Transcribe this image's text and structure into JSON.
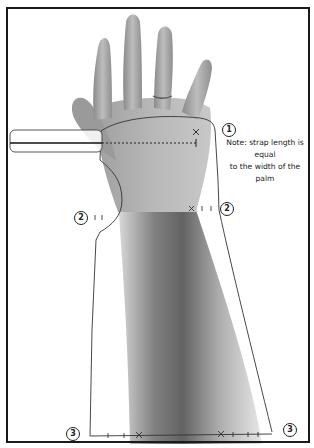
{
  "figure": {
    "note": {
      "line1": "Note: strap length is equal",
      "line2": "to the width of the palm"
    },
    "markers": [
      {
        "id": "marker-1",
        "label": "1"
      },
      {
        "id": "marker-2-left",
        "label": "2"
      },
      {
        "id": "marker-2-right",
        "label": "2"
      },
      {
        "id": "marker-3-left",
        "label": "3"
      },
      {
        "id": "marker-3-right",
        "label": "3"
      }
    ],
    "colors": {
      "background": "#ffffff",
      "frame": "#1a1a1a",
      "outline": "#333333",
      "skin_dark": "#6e6e6e",
      "skin_light": "#bdbdbd"
    }
  }
}
